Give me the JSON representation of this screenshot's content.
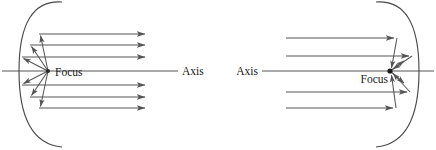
{
  "figure": {
    "stroke_color": "#555555",
    "curve_color": "#4a4a4a",
    "text_color": "#1a1a1a",
    "background": "#ffffff",
    "width": 436,
    "height": 150
  },
  "diagrams": [
    {
      "id": "left-parabola",
      "description": "Parabola opening rightward; rays emanate from the focus, reflect off the mirror, and leave parallel to the axis",
      "direction": "diverging-from-focus",
      "focus_label": "Focus",
      "axis_label": "Axis",
      "focus_point": {
        "x": 48,
        "y": 71
      },
      "vertex": {
        "x": 19,
        "y": 71
      },
      "axis_line": {
        "x1": 2,
        "y1": 71,
        "x2": 178,
        "y2": 71
      },
      "ray_count": 6,
      "parallel_rays": [
        {
          "y": 34,
          "x_start": 39,
          "x_end": 148
        },
        {
          "y": 45,
          "x_start": 30,
          "x_end": 148
        },
        {
          "y": 57,
          "x_start": 22,
          "x_end": 148
        },
        {
          "y": 85,
          "x_start": 22,
          "x_end": 148
        },
        {
          "y": 97,
          "x_start": 30,
          "x_end": 148
        },
        {
          "y": 108,
          "x_start": 39,
          "x_end": 148
        }
      ],
      "arrow_direction": "right"
    },
    {
      "id": "right-parabola",
      "description": "Parabola opening leftward; parallel rays arrive from the left, reflect off the mirror, and converge at the focus",
      "direction": "converging-to-focus",
      "focus_label": "Focus",
      "axis_label": "Axis",
      "focus_point": {
        "x": 390,
        "y": 71
      },
      "vertex": {
        "x": 419,
        "y": 71
      },
      "axis_line": {
        "x1": 262,
        "y1": 71,
        "x2": 434,
        "y2": 71
      },
      "ray_count": 4,
      "parallel_rays": [
        {
          "y": 38,
          "x_start": 286,
          "x_end": 397
        },
        {
          "y": 56,
          "x_start": 286,
          "x_end": 412
        },
        {
          "y": 92,
          "x_start": 286,
          "x_end": 410
        },
        {
          "y": 108,
          "x_start": 286,
          "x_end": 396
        }
      ],
      "arrow_direction": "right"
    }
  ],
  "labels": {
    "left_focus": "Focus",
    "left_axis": "Axis",
    "right_axis": "Axis",
    "right_focus": "Focus"
  }
}
